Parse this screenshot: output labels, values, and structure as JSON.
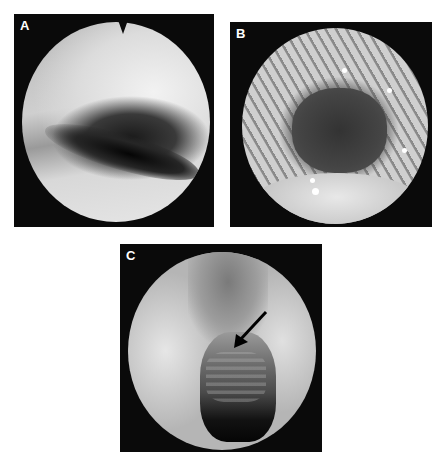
{
  "figure": {
    "panels": [
      {
        "label": "A",
        "description": "endoscopic view, smooth pale mucosa with dark curved groove"
      },
      {
        "label": "B",
        "description": "endoscopic view, ridged circumferential folds around dark lumen"
      },
      {
        "label": "C",
        "description": "endoscopic view, central cavity with ringed structure indicated by arrow"
      }
    ],
    "annotations": {
      "panel_c_arrow": "arrow-pointing-down-left"
    }
  }
}
